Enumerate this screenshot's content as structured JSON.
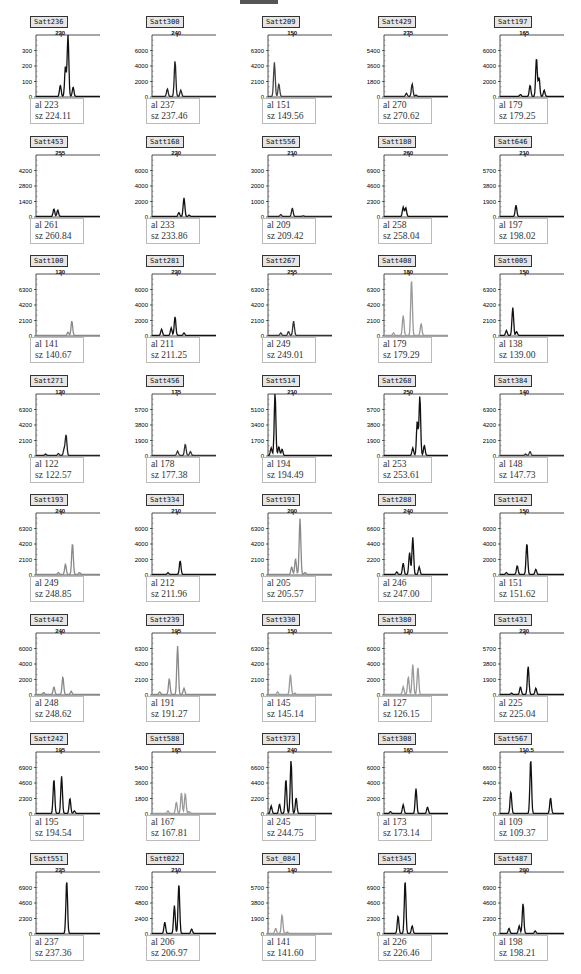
{
  "header": {
    "decorative_bar": true
  },
  "chart_data": {
    "type": "line",
    "panels": [
      {
        "marker": "Satt236",
        "xtick": "220",
        "yticks": [
          "0",
          "100",
          "200",
          "300"
        ],
        "ymax": 400,
        "al": "223",
        "sz": "224.11",
        "color": "#111",
        "peaks": [
          [
            0.38,
            0.18
          ],
          [
            0.46,
            0.48
          ],
          [
            0.5,
            1.0
          ],
          [
            0.58,
            0.15
          ]
        ]
      },
      {
        "marker": "Satt300",
        "xtick": "240",
        "yticks": [
          "0",
          "2000",
          "4000",
          "6000"
        ],
        "ymax": 8000,
        "al": "237",
        "sz": "237.46",
        "color": "#222",
        "peaks": [
          [
            0.24,
            0.12
          ],
          [
            0.36,
            0.57
          ],
          [
            0.45,
            0.1
          ]
        ]
      },
      {
        "marker": "Satt209",
        "xtick": "150",
        "yticks": [
          "0",
          "2100",
          "4200",
          "6300"
        ],
        "ymax": 8400,
        "al": "151",
        "sz": "149.56",
        "color": "#444",
        "peaks": [
          [
            0.1,
            0.55
          ],
          [
            0.17,
            0.2
          ]
        ]
      },
      {
        "marker": "Satt429",
        "xtick": "275",
        "yticks": [
          "0",
          "1800",
          "3600",
          "5400"
        ],
        "ymax": 7200,
        "al": "270",
        "sz": "270.62",
        "color": "#222",
        "peaks": [
          [
            0.35,
            0.05
          ],
          [
            0.44,
            0.2
          ],
          [
            0.5,
            0.02
          ]
        ]
      },
      {
        "marker": "Satt197",
        "xtick": "165",
        "yticks": [
          "0",
          "2000",
          "4000",
          "6000"
        ],
        "ymax": 8000,
        "al": "179",
        "sz": "179.25",
        "color": "#111",
        "peaks": [
          [
            0.32,
            0.03
          ],
          [
            0.47,
            0.18
          ],
          [
            0.57,
            0.62
          ],
          [
            0.61,
            0.3
          ],
          [
            0.69,
            0.1
          ]
        ]
      },
      {
        "marker": "Satt453",
        "xtick": "255",
        "yticks": [
          "0",
          "1400",
          "2800",
          "4200"
        ],
        "ymax": 5600,
        "al": "261",
        "sz": "260.84",
        "color": "#111",
        "peaks": [
          [
            0.28,
            0.12
          ],
          [
            0.34,
            0.1
          ]
        ]
      },
      {
        "marker": "Satt168",
        "xtick": "220",
        "yticks": [
          "0",
          "2000",
          "4000",
          "6000"
        ],
        "ymax": 8000,
        "al": "233",
        "sz": "233.86",
        "color": "#111",
        "peaks": [
          [
            0.42,
            0.06
          ],
          [
            0.5,
            0.3
          ],
          [
            0.58,
            0.02
          ]
        ]
      },
      {
        "marker": "Satt556",
        "xtick": "210",
        "yticks": [
          "0",
          "1000",
          "2000",
          "3000"
        ],
        "ymax": 4000,
        "al": "209",
        "sz": "209.42",
        "color": "#222",
        "peaks": [
          [
            0.2,
            0.03
          ],
          [
            0.38,
            0.13
          ],
          [
            0.55,
            0.01
          ]
        ]
      },
      {
        "marker": "Satt180",
        "xtick": "260",
        "yticks": [
          "0",
          "2300",
          "4600",
          "6900"
        ],
        "ymax": 9200,
        "al": "258",
        "sz": "258.04",
        "color": "#111",
        "peaks": [
          [
            0.3,
            0.15
          ],
          [
            0.34,
            0.14
          ]
        ]
      },
      {
        "marker": "Satt646",
        "xtick": "210",
        "yticks": [
          "0",
          "1900",
          "3800",
          "5700"
        ],
        "ymax": 7600,
        "al": "197",
        "sz": "198.02",
        "color": "#111",
        "peaks": [
          [
            0.25,
            0.18
          ]
        ]
      },
      {
        "marker": "Satt100",
        "xtick": "120",
        "yticks": [
          "0",
          "2100",
          "4200",
          "6300"
        ],
        "ymax": 8400,
        "al": "141",
        "sz": "140.67",
        "color": "#888",
        "peaks": [
          [
            0.5,
            0.05
          ],
          [
            0.56,
            0.23
          ]
        ]
      },
      {
        "marker": "Satt281",
        "xtick": "220",
        "yticks": [
          "0",
          "2000",
          "4000",
          "6000"
        ],
        "ymax": 8000,
        "al": "211",
        "sz": "211.25",
        "color": "#111",
        "peaks": [
          [
            0.15,
            0.1
          ],
          [
            0.3,
            0.12
          ],
          [
            0.36,
            0.3
          ],
          [
            0.5,
            0.04
          ]
        ]
      },
      {
        "marker": "Satt267",
        "xtick": "255",
        "yticks": [
          "0",
          "2100",
          "4200",
          "6300"
        ],
        "ymax": 8400,
        "al": "249",
        "sz": "249.01",
        "color": "#333",
        "peaks": [
          [
            0.2,
            0.04
          ],
          [
            0.32,
            0.06
          ],
          [
            0.4,
            0.23
          ]
        ]
      },
      {
        "marker": "Satt408",
        "xtick": "180",
        "yticks": [
          "0",
          "2100",
          "4200",
          "6300"
        ],
        "ymax": 8400,
        "al": "179",
        "sz": "179.29",
        "color": "#999",
        "peaks": [
          [
            0.15,
            0.04
          ],
          [
            0.3,
            0.32
          ],
          [
            0.43,
            0.9
          ],
          [
            0.58,
            0.19
          ]
        ]
      },
      {
        "marker": "Satt005",
        "xtick": "150",
        "yticks": [
          "0",
          "2100",
          "4200",
          "6300"
        ],
        "ymax": 8400,
        "al": "138",
        "sz": "139.00",
        "color": "#111",
        "peaks": [
          [
            0.1,
            0.08
          ],
          [
            0.2,
            0.45
          ],
          [
            0.26,
            0.06
          ]
        ]
      },
      {
        "marker": "Satt271",
        "xtick": "120",
        "yticks": [
          "0",
          "2100",
          "4200",
          "6300"
        ],
        "ymax": 8400,
        "al": "122",
        "sz": "122.57",
        "color": "#222",
        "peaks": [
          [
            0.15,
            0.02
          ],
          [
            0.35,
            0.03
          ],
          [
            0.44,
            0.1
          ],
          [
            0.47,
            0.33
          ]
        ]
      },
      {
        "marker": "Satt456",
        "xtick": "175",
        "yticks": [
          "0",
          "1900",
          "3800",
          "5700"
        ],
        "ymax": 7600,
        "al": "178",
        "sz": "177.38",
        "color": "#333",
        "peaks": [
          [
            0.4,
            0.07
          ],
          [
            0.52,
            0.18
          ],
          [
            0.6,
            0.06
          ]
        ]
      },
      {
        "marker": "Satt514",
        "xtick": "210",
        "yticks": [
          "0",
          "1700",
          "3400",
          "5100"
        ],
        "ymax": 6800,
        "al": "194",
        "sz": "194.49",
        "color": "#111",
        "peaks": [
          [
            0.05,
            0.12
          ],
          [
            0.11,
            1.0
          ],
          [
            0.17,
            0.14
          ],
          [
            0.22,
            0.1
          ]
        ]
      },
      {
        "marker": "Satt268",
        "xtick": "250",
        "yticks": [
          "0",
          "1900",
          "3800",
          "5700"
        ],
        "ymax": 7600,
        "al": "253",
        "sz": "253.61",
        "color": "#111",
        "peaks": [
          [
            0.45,
            0.12
          ],
          [
            0.52,
            0.55
          ],
          [
            0.56,
            0.95
          ],
          [
            0.63,
            0.16
          ]
        ]
      },
      {
        "marker": "Satt384",
        "xtick": "140",
        "yticks": [
          "0",
          "2100",
          "4200",
          "6300"
        ],
        "ymax": 8400,
        "al": "148",
        "sz": "147.73",
        "color": "#333",
        "peaks": [
          [
            0.4,
            0.02
          ],
          [
            0.47,
            0.06
          ]
        ]
      },
      {
        "marker": "Satt193",
        "xtick": "240",
        "yticks": [
          "0",
          "2100",
          "4200",
          "6300"
        ],
        "ymax": 8400,
        "al": "249",
        "sz": "248.85",
        "color": "#888",
        "peaks": [
          [
            0.35,
            0.03
          ],
          [
            0.46,
            0.16
          ],
          [
            0.57,
            0.5
          ],
          [
            0.68,
            0.03
          ]
        ]
      },
      {
        "marker": "Satt334",
        "xtick": "210",
        "yticks": [
          "0",
          "2000",
          "4000",
          "6000"
        ],
        "ymax": 8000,
        "al": "212",
        "sz": "211.96",
        "color": "#111",
        "peaks": [
          [
            0.25,
            0.03
          ],
          [
            0.44,
            0.22
          ]
        ]
      },
      {
        "marker": "Satt191",
        "xtick": "200",
        "yticks": [
          "0",
          "2100",
          "4200",
          "6300"
        ],
        "ymax": 8400,
        "al": "205",
        "sz": "205.57",
        "color": "#888",
        "peaks": [
          [
            0.37,
            0.12
          ],
          [
            0.43,
            0.25
          ],
          [
            0.5,
            0.9
          ],
          [
            0.58,
            0.03
          ]
        ]
      },
      {
        "marker": "Satt288",
        "xtick": "240",
        "yticks": [
          "0",
          "2200",
          "4400",
          "6600"
        ],
        "ymax": 8800,
        "al": "246",
        "sz": "247.00",
        "color": "#111",
        "peaks": [
          [
            0.2,
            0.04
          ],
          [
            0.3,
            0.18
          ],
          [
            0.4,
            0.35
          ],
          [
            0.45,
            0.6
          ],
          [
            0.55,
            0.12
          ]
        ]
      },
      {
        "marker": "Satt142",
        "xtick": "150",
        "yticks": [
          "0",
          "2000",
          "4000",
          "6000"
        ],
        "ymax": 8000,
        "al": "151",
        "sz": "151.62",
        "color": "#111",
        "peaks": [
          [
            0.1,
            0.03
          ],
          [
            0.27,
            0.14
          ],
          [
            0.42,
            0.5
          ],
          [
            0.56,
            0.08
          ]
        ]
      },
      {
        "marker": "Satt442",
        "xtick": "240",
        "yticks": [
          "0",
          "2000",
          "4000",
          "6000"
        ],
        "ymax": 8000,
        "al": "248",
        "sz": "248.62",
        "color": "#888",
        "peaks": [
          [
            0.12,
            0.03
          ],
          [
            0.28,
            0.12
          ],
          [
            0.42,
            0.28
          ],
          [
            0.55,
            0.05
          ]
        ]
      },
      {
        "marker": "Satt239",
        "xtick": "195",
        "yticks": [
          "0",
          "2100",
          "4200",
          "6300"
        ],
        "ymax": 8400,
        "al": "191",
        "sz": "191.27",
        "color": "#888",
        "peaks": [
          [
            0.12,
            0.04
          ],
          [
            0.27,
            0.25
          ],
          [
            0.4,
            0.78
          ],
          [
            0.5,
            0.1
          ]
        ]
      },
      {
        "marker": "Satt330",
        "xtick": "150",
        "yticks": [
          "0",
          "2100",
          "4200",
          "6300"
        ],
        "ymax": 8400,
        "al": "145",
        "sz": "145.14",
        "color": "#999",
        "peaks": [
          [
            0.15,
            0.04
          ],
          [
            0.35,
            0.32
          ],
          [
            0.42,
            0.02
          ]
        ]
      },
      {
        "marker": "Satt380",
        "xtick": "120",
        "yticks": [
          "0",
          "2000",
          "4000",
          "6000"
        ],
        "ymax": 8000,
        "al": "127",
        "sz": "126.15",
        "color": "#999",
        "peaks": [
          [
            0.3,
            0.12
          ],
          [
            0.38,
            0.28
          ],
          [
            0.45,
            0.48
          ],
          [
            0.53,
            0.44
          ]
        ]
      },
      {
        "marker": "Satt431",
        "xtick": "220",
        "yticks": [
          "0",
          "1900",
          "3800",
          "5700"
        ],
        "ymax": 7600,
        "al": "225",
        "sz": "225.04",
        "color": "#111",
        "peaks": [
          [
            0.18,
            0.02
          ],
          [
            0.32,
            0.12
          ],
          [
            0.44,
            0.45
          ],
          [
            0.56,
            0.1
          ]
        ]
      },
      {
        "marker": "Satt242",
        "xtick": "195",
        "yticks": [
          "0",
          "2300",
          "4600",
          "6900"
        ],
        "ymax": 9200,
        "al": "195",
        "sz": "194.54",
        "color": "#111",
        "peaks": [
          [
            0.28,
            0.55
          ],
          [
            0.4,
            0.6
          ],
          [
            0.53,
            0.24
          ],
          [
            0.6,
            0.04
          ]
        ]
      },
      {
        "marker": "Satt588",
        "xtick": "165",
        "yticks": [
          "0",
          "1800",
          "3600",
          "5400"
        ],
        "ymax": 7200,
        "al": "167",
        "sz": "167.81",
        "color": "#999",
        "peaks": [
          [
            0.25,
            0.04
          ],
          [
            0.38,
            0.18
          ],
          [
            0.46,
            0.33
          ],
          [
            0.52,
            0.32
          ],
          [
            0.58,
            0.03
          ]
        ]
      },
      {
        "marker": "Satt373",
        "xtick": "240",
        "yticks": [
          "0",
          "2200",
          "4400",
          "6600"
        ],
        "ymax": 8800,
        "al": "245",
        "sz": "244.75",
        "color": "#111",
        "peaks": [
          [
            0.05,
            0.12
          ],
          [
            0.18,
            0.15
          ],
          [
            0.28,
            0.55
          ],
          [
            0.36,
            0.85
          ],
          [
            0.44,
            0.25
          ]
        ]
      },
      {
        "marker": "Satt308",
        "xtick": "165",
        "yticks": [
          "0",
          "2000",
          "4000",
          "6000"
        ],
        "ymax": 8000,
        "al": "173",
        "sz": "173.14",
        "color": "#111",
        "peaks": [
          [
            0.1,
            0.03
          ],
          [
            0.3,
            0.14
          ],
          [
            0.5,
            0.4
          ],
          [
            0.68,
            0.1
          ]
        ]
      },
      {
        "marker": "Satt567",
        "xtick": "110.5",
        "yticks": [
          "0",
          "2200",
          "4400",
          "6600"
        ],
        "ymax": 8800,
        "al": "109",
        "sz": "109.37",
        "color": "#111",
        "peaks": [
          [
            0.17,
            0.35
          ],
          [
            0.48,
            0.87
          ],
          [
            0.79,
            0.25
          ]
        ]
      },
      {
        "marker": "Satt551",
        "xtick": "225",
        "yticks": [
          "0",
          "2300",
          "4600",
          "6900"
        ],
        "ymax": 9200,
        "al": "237",
        "sz": "237.36",
        "color": "#111",
        "peaks": [
          [
            0.48,
            0.85
          ]
        ]
      },
      {
        "marker": "Satt022",
        "xtick": "210",
        "yticks": [
          "0",
          "2400",
          "4800",
          "7200"
        ],
        "ymax": 9600,
        "al": "206",
        "sz": "206.97",
        "color": "#111",
        "peaks": [
          [
            0.2,
            0.18
          ],
          [
            0.35,
            0.45
          ],
          [
            0.42,
            0.8
          ],
          [
            0.62,
            0.07
          ]
        ]
      },
      {
        "marker": "Sat_084",
        "xtick": "140",
        "yticks": [
          "0",
          "1900",
          "3800",
          "5700"
        ],
        "ymax": 7600,
        "al": "141",
        "sz": "141.60",
        "color": "#999",
        "peaks": [
          [
            0.12,
            0.08
          ],
          [
            0.22,
            0.3
          ],
          [
            0.3,
            0.02
          ]
        ]
      },
      {
        "marker": "Satt345",
        "xtick": "225",
        "yticks": [
          "0",
          "2300",
          "4600",
          "6900"
        ],
        "ymax": 9200,
        "al": "226",
        "sz": "226.46",
        "color": "#111",
        "peaks": [
          [
            0.22,
            0.28
          ],
          [
            0.33,
            0.85
          ],
          [
            0.44,
            0.12
          ]
        ]
      },
      {
        "marker": "Satt487",
        "xtick": "200",
        "yticks": [
          "0",
          "2300",
          "4600",
          "6900"
        ],
        "ymax": 9200,
        "al": "198",
        "sz": "198.21",
        "color": "#111",
        "peaks": [
          [
            0.14,
            0.08
          ],
          [
            0.3,
            0.12
          ],
          [
            0.36,
            0.48
          ],
          [
            0.55,
            0.04
          ]
        ]
      }
    ],
    "legend_labels": {
      "allele": "al",
      "size": "sz"
    },
    "grid_layout": {
      "columns": 5,
      "rows": 8
    }
  }
}
